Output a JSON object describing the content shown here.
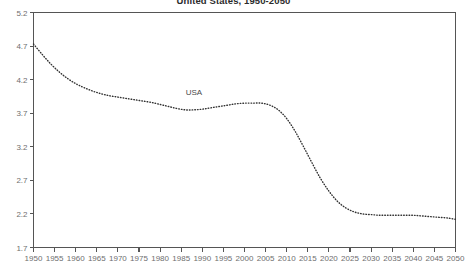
{
  "chart_data": {
    "type": "line",
    "title": "United States, 1950-2050",
    "xlabel": "",
    "ylabel": "",
    "xlim": [
      1950,
      2050
    ],
    "ylim": [
      1.7,
      5.2
    ],
    "ytick_step": 0.5,
    "xtick_step": 5,
    "grid": false,
    "legend": "none",
    "line_style": "dotted",
    "line_color": "#333333",
    "axis_color": "#555555",
    "annotations": [
      {
        "text": "USA",
        "x": 1988,
        "y": 3.97
      }
    ],
    "xticks": [
      1950,
      1955,
      1960,
      1965,
      1970,
      1975,
      1980,
      1985,
      1990,
      1995,
      2000,
      2005,
      2010,
      2015,
      2020,
      2025,
      2030,
      2035,
      2040,
      2045,
      2050
    ],
    "yticks": [
      1.7,
      2.2,
      2.7,
      3.2,
      3.7,
      4.2,
      4.7,
      5.2
    ],
    "series": [
      {
        "name": "USA",
        "x": [
          1950,
          1952,
          1954,
          1956,
          1958,
          1960,
          1962,
          1964,
          1966,
          1968,
          1970,
          1972,
          1974,
          1976,
          1978,
          1980,
          1982,
          1984,
          1986,
          1988,
          1990,
          1992,
          1994,
          1996,
          1998,
          2000,
          2002,
          2004,
          2006,
          2008,
          2010,
          2012,
          2014,
          2016,
          2018,
          2020,
          2022,
          2024,
          2026,
          2028,
          2030,
          2032,
          2034,
          2036,
          2038,
          2040,
          2042,
          2044,
          2046,
          2048,
          2050
        ],
        "values": [
          4.73,
          4.58,
          4.44,
          4.32,
          4.22,
          4.14,
          4.08,
          4.03,
          3.99,
          3.96,
          3.94,
          3.92,
          3.9,
          3.88,
          3.86,
          3.83,
          3.8,
          3.77,
          3.75,
          3.75,
          3.76,
          3.78,
          3.8,
          3.82,
          3.84,
          3.85,
          3.85,
          3.85,
          3.82,
          3.75,
          3.62,
          3.43,
          3.2,
          2.96,
          2.73,
          2.54,
          2.39,
          2.29,
          2.23,
          2.2,
          2.19,
          2.18,
          2.18,
          2.18,
          2.18,
          2.18,
          2.17,
          2.16,
          2.15,
          2.14,
          2.12
        ]
      }
    ]
  }
}
